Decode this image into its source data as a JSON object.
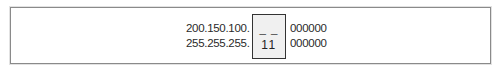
{
  "diagram": {
    "rows": [
      {
        "prefix": "200.150.100.",
        "highlight": "_ _",
        "suffix": "000000"
      },
      {
        "prefix": "255.255.255.",
        "highlight": "11",
        "suffix": "000000"
      }
    ],
    "colors": {
      "border": "#8a8a8a",
      "highlight_bg": "#f0f0f0",
      "highlight_border": "#333333",
      "text": "#2a2a2a"
    }
  }
}
